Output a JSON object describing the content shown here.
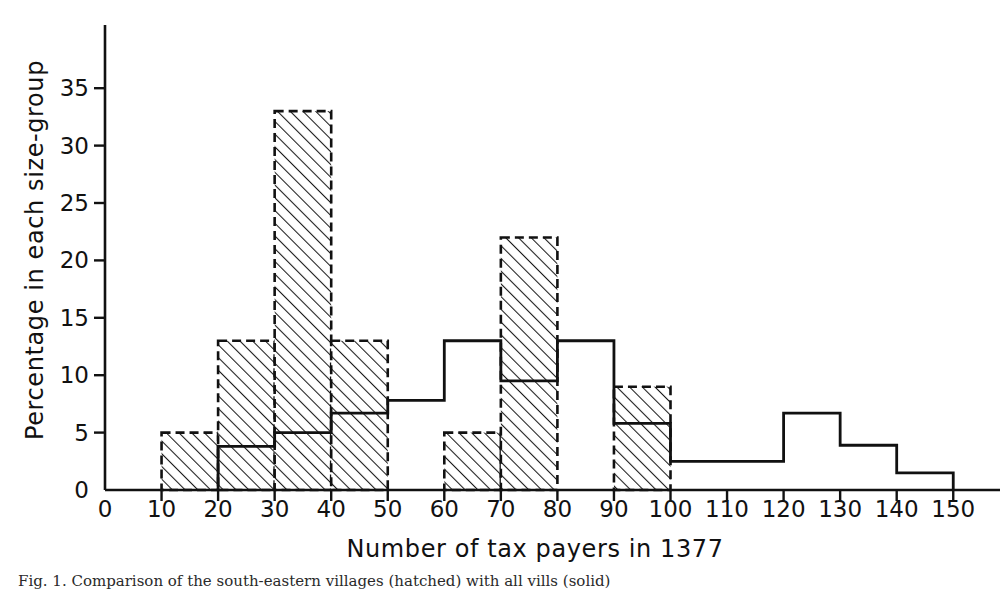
{
  "chart_data": {
    "type": "bar",
    "title": "",
    "xlabel": "Number of tax payers in 1377",
    "ylabel": "Percentage in each size-group",
    "xlim": [
      0,
      155
    ],
    "ylim": [
      0,
      38.5
    ],
    "grid": false,
    "legend": null,
    "bin_width": 10,
    "xticks": [
      0,
      10,
      20,
      30,
      40,
      50,
      60,
      70,
      80,
      90,
      100,
      110,
      120,
      130,
      140,
      150
    ],
    "xtick_labels": [
      "0",
      "10",
      "20",
      "30",
      "40",
      "50",
      "60",
      "70",
      "80",
      "90",
      "100",
      "110",
      "120",
      "130",
      "140",
      "150"
    ],
    "yticks": [
      0,
      5,
      10,
      15,
      20,
      25,
      30,
      35
    ],
    "ytick_labels": [
      "0",
      "5",
      "10",
      "15",
      "20",
      "25",
      "30",
      "35"
    ],
    "bin_starts": [
      0,
      10,
      20,
      30,
      40,
      50,
      60,
      70,
      80,
      90,
      100,
      110,
      120,
      130,
      140
    ],
    "bin_labels": [
      "0-10",
      "10-20",
      "20-30",
      "30-40",
      "40-50",
      "50-60",
      "60-70",
      "70-80",
      "80-90",
      "90-100",
      "100-110",
      "110-120",
      "120-130",
      "130-140",
      "140-150"
    ],
    "series": [
      {
        "name": "hatched-series",
        "style": "dashed-outline-hatched",
        "values": [
          0,
          5,
          13,
          33,
          13,
          0,
          5,
          22,
          0,
          9,
          0,
          0,
          0,
          0,
          0
        ]
      },
      {
        "name": "solid-outline-series",
        "style": "solid-step-outline",
        "values": [
          0,
          0,
          3.8,
          5,
          6.7,
          7.8,
          13,
          9.5,
          13,
          5.8,
          2.5,
          2.5,
          6.7,
          3.9,
          1.5
        ]
      }
    ]
  },
  "axis": {
    "x_title": "Number of tax payers in 1377",
    "y_title": "Percentage in each size-group"
  },
  "caption": {
    "text": "Fig. 1. Comparison of the south-eastern villages (hatched) with all vills (solid)"
  },
  "colors": {
    "ink": "#111111",
    "background": "#ffffff",
    "hatch": "#1a1a1a"
  }
}
